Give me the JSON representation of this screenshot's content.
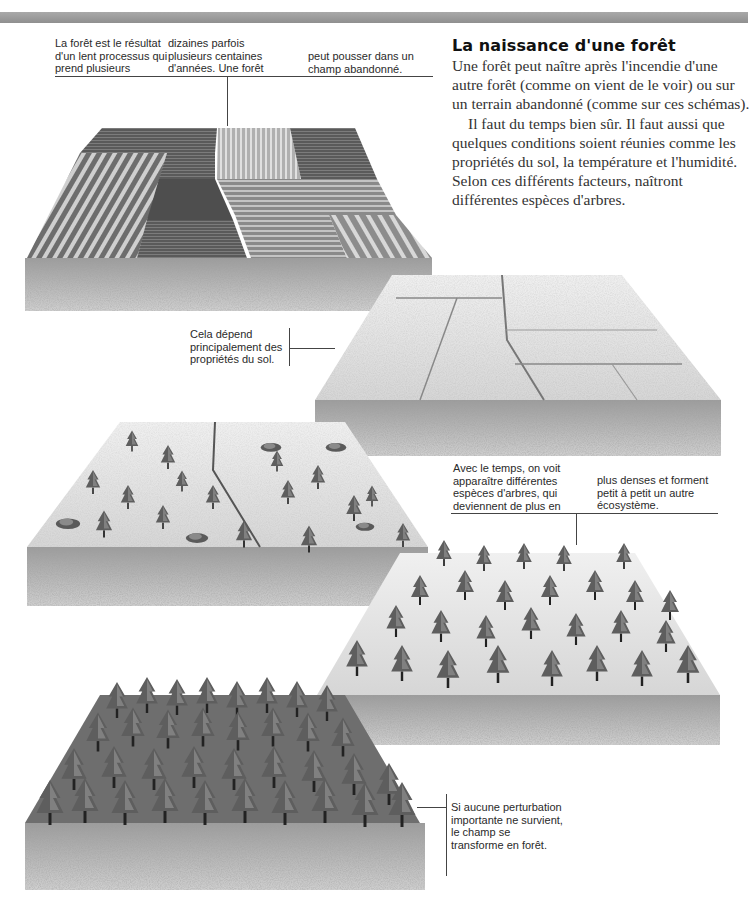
{
  "header_bar": {
    "color": "#9a9a9a"
  },
  "captions": {
    "intro_col1": "La forêt  est le résultat\nd'un lent processus qui\nprend plusieurs",
    "intro_col2": "dizaines parfois\nplusieurs centaines\nd'années. Une forêt",
    "intro_col3": "peut pousser dans un\nchamp abandonné.",
    "soil": "Cela dépend\nprincipalement des\npropriétés du sol.",
    "species_col1": "Avec le temps, on voit\napparaître différentes\nespèces d'arbres, qui\ndeviennent de plus en",
    "species_col2": "plus denses et forment\npetit à petit un autre\nécosystème.",
    "final": "Si aucune perturbation\nimportante ne survient,\nle champ se\ntransforme en forêt."
  },
  "article": {
    "title": "La naissance d'une forêt",
    "paragraphs": [
      "Une forêt peut naître après l'incendie d'une autre forêt (comme on vient de le voir) ou sur un terrain abandonné (comme sur ces schémas).",
      "Il faut du temps bien sûr. Il faut aussi que quelques conditions soient réunies comme les propriétés du sol, la température et l'humidité. Selon ces différents facteurs, naîtront différentes espèces d'arbres."
    ]
  },
  "illustrations": [
    {
      "stage": 1,
      "label": "cultivated-field"
    },
    {
      "stage": 2,
      "label": "abandoned-field"
    },
    {
      "stage": 3,
      "label": "sparse-trees"
    },
    {
      "stage": 4,
      "label": "denser-trees"
    },
    {
      "stage": 5,
      "label": "mature-forest"
    }
  ]
}
